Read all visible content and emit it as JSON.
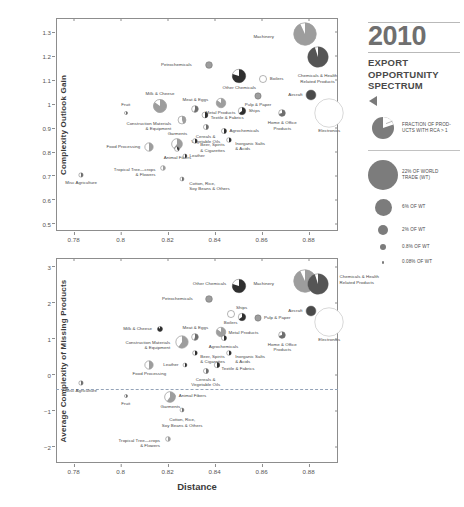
{
  "sidebar": {
    "year": "2010",
    "subtitle": "EXPORT\nOPPORTUNITY\nSPECTRUM",
    "triangle_icon": "left-triangle-icon",
    "legend": {
      "pie_note": "FRACTION OF PROD-\nUCTS WITH RCA > 1",
      "sizes": [
        {
          "label": "22% OF WORLD\nTRADE (WT)",
          "d": 30
        },
        {
          "label": "6% OF WT",
          "d": 17
        },
        {
          "label": "2% OF WT",
          "d": 10
        },
        {
          "label": "0.8% OF WT",
          "d": 6
        },
        {
          "label": "0.08% OF WT",
          "d": 2.5
        }
      ]
    }
  },
  "chart_data": [
    {
      "id": "top",
      "type": "scatter",
      "title": "",
      "xlabel": "Distance",
      "ylabel": "Complexity Outlook Gain",
      "xlim": [
        0.7725,
        0.8925
      ],
      "ylim": [
        0.47,
        1.36
      ],
      "xticks": [
        0.78,
        0.8,
        0.82,
        0.84,
        0.86,
        0.88
      ],
      "xticklabels": [
        "0.78",
        "0.8",
        "0.82",
        "0.84",
        "0.86",
        "0.88"
      ],
      "yticks": [
        0.5,
        0.6,
        0.7,
        0.8,
        0.9,
        1.0,
        1.1,
        1.2,
        1.3
      ],
      "yticklabels": [
        "0.5",
        "0.6",
        "0.7",
        "0.8",
        "0.9",
        "1",
        "1.1",
        "1.2",
        "1.3"
      ],
      "grid": false,
      "legend": "none",
      "points": [
        {
          "name": "Machinery",
          "x": 0.8785,
          "y": 1.295,
          "r": 11.5,
          "frac": 0.93,
          "shade": "#9d9d9d",
          "lx": -31,
          "ly": 3,
          "align": "right"
        },
        {
          "name": "Chemicals & Health\nRelated Products",
          "x": 0.8838,
          "y": 1.195,
          "r": 10.5,
          "frac": 0.95,
          "shade": "#555555",
          "lx": 0,
          "ly": 19,
          "align": "center"
        },
        {
          "name": "Petrochemicals",
          "x": 0.8375,
          "y": 1.165,
          "r": 3.6,
          "frac": 1.0,
          "shade": "#9d9d9d",
          "lx": -17,
          "ly": 0,
          "align": "right"
        },
        {
          "name": "Other Chemicals",
          "x": 0.8505,
          "y": 1.118,
          "r": 7.0,
          "frac": 0.8,
          "shade": "#2f2f2f",
          "lx": 0,
          "ly": 12,
          "align": "center"
        },
        {
          "name": "Boilers",
          "x": 0.8605,
          "y": 1.105,
          "r": 3.8,
          "frac": 0.0,
          "shade": "#c8c8c8",
          "lx": 7,
          "ly": 0,
          "align": "left"
        },
        {
          "name": "Aircraft",
          "x": 0.8808,
          "y": 1.04,
          "r": 5.2,
          "frac": 1.0,
          "shade": "#4a4a4a",
          "lx": -8,
          "ly": 0,
          "align": "right"
        },
        {
          "name": "Pulp & Paper",
          "x": 0.8585,
          "y": 1.035,
          "r": 3.4,
          "frac": 1.0,
          "shade": "#9d9d9d",
          "lx": 0,
          "ly": 9,
          "align": "center"
        },
        {
          "name": "Electronics",
          "x": 0.8888,
          "y": 0.965,
          "r": 14.5,
          "frac": 0.0,
          "shade": "#e4e4e4",
          "lx": 0,
          "ly": 18,
          "align": "center"
        },
        {
          "name": "Metal Products",
          "x": 0.8425,
          "y": 1.003,
          "r": 5.0,
          "frac": 0.85,
          "shade": "#9d9d9d",
          "lx": 0,
          "ly": 10,
          "align": "center"
        },
        {
          "name": "Ships",
          "x": 0.8515,
          "y": 0.972,
          "r": 4.0,
          "frac": 0.65,
          "shade": "#2f2f2f",
          "lx": 7,
          "ly": 0,
          "align": "left"
        },
        {
          "name": "Home & Office\nProducts",
          "x": 0.8688,
          "y": 0.962,
          "r": 3.6,
          "frac": 0.7,
          "shade": "#6e6e6e",
          "lx": 0,
          "ly": 10,
          "align": "center"
        },
        {
          "name": "Milk & Cheese",
          "x": 0.8168,
          "y": 0.993,
          "r": 6.8,
          "frac": 0.85,
          "shade": "#9d9d9d",
          "lx": 0,
          "ly": -12,
          "align": "center"
        },
        {
          "name": "Meat & Eggs",
          "x": 0.8318,
          "y": 0.978,
          "r": 3.6,
          "frac": 0.55,
          "shade": "#6e6e6e",
          "lx": 0,
          "ly": -9,
          "align": "center"
        },
        {
          "name": "Textile & Fabrics",
          "x": 0.8358,
          "y": 0.955,
          "r": 3.2,
          "frac": 0.5,
          "shade": "#2f2f2f",
          "lx": 6,
          "ly": 3,
          "align": "left"
        },
        {
          "name": "Fruit",
          "x": 0.8022,
          "y": 0.965,
          "r": 1.8,
          "frac": 0.5,
          "shade": "#6e6e6e",
          "lx": 0,
          "ly": -8,
          "align": "center"
        },
        {
          "name": "Construction Materials\n& Equipment",
          "x": 0.8262,
          "y": 0.935,
          "r": 4.2,
          "frac": 0.45,
          "shade": "#9d9d9d",
          "lx": -11,
          "ly": 4,
          "align": "right"
        },
        {
          "name": "Cereals &\nVegetable Oils",
          "x": 0.8362,
          "y": 0.905,
          "r": 2.8,
          "frac": 0.5,
          "shade": "#6e6e6e",
          "lx": 0,
          "ly": 10,
          "align": "center"
        },
        {
          "name": "Agrochemicals",
          "x": 0.8438,
          "y": 0.888,
          "r": 2.8,
          "frac": 0.5,
          "shade": "#2f2f2f",
          "lx": 6,
          "ly": 0,
          "align": "left"
        },
        {
          "name": "Inorganic Salts\n& Acids",
          "x": 0.8462,
          "y": 0.852,
          "r": 2.6,
          "frac": 0.5,
          "shade": "#2f2f2f",
          "lx": 6,
          "ly": 4,
          "align": "left"
        },
        {
          "name": "Beer, Spirits\n& Cigarettes",
          "x": 0.8318,
          "y": 0.845,
          "r": 2.6,
          "frac": 0.5,
          "shade": "#2f2f2f",
          "lx": 5,
          "ly": 4,
          "align": "left"
        },
        {
          "name": "Garments",
          "x": 0.8242,
          "y": 0.832,
          "r": 5.6,
          "frac": 0.6,
          "shade": "#9d9d9d",
          "lx": 0,
          "ly": -10,
          "align": "center"
        },
        {
          "name": "Animal Fibers",
          "x": 0.8242,
          "y": 0.812,
          "r": 2.6,
          "frac": 0.4,
          "shade": "#3a3a3a",
          "lx": 0,
          "ly": 9,
          "align": "center"
        },
        {
          "name": "Food Processing",
          "x": 0.8122,
          "y": 0.822,
          "r": 4.4,
          "frac": 0.5,
          "shade": "#9d9d9d",
          "lx": -9,
          "ly": 0,
          "align": "right"
        },
        {
          "name": "Leather",
          "x": 0.8272,
          "y": 0.782,
          "r": 2.2,
          "frac": 0.5,
          "shade": "#2f2f2f",
          "lx": 5,
          "ly": 0,
          "align": "left"
        },
        {
          "name": "Misc Agriculture",
          "x": 0.7832,
          "y": 0.702,
          "r": 2.4,
          "frac": 0.5,
          "shade": "#6e6e6e",
          "lx": 0,
          "ly": 8,
          "align": "center"
        },
        {
          "name": "Tropical Tree—crops\n& Flowers",
          "x": 0.8182,
          "y": 0.735,
          "r": 2.6,
          "frac": 0.5,
          "shade": "#9d9d9d",
          "lx": -8,
          "ly": 2,
          "align": "right"
        },
        {
          "name": "Cotton, Rice,\nSoy Beans & Others",
          "x": 0.8262,
          "y": 0.688,
          "r": 2.2,
          "frac": 0.5,
          "shade": "#6e6e6e",
          "lx": 7,
          "ly": 5,
          "align": "left"
        }
      ]
    },
    {
      "id": "bottom",
      "type": "scatter",
      "title": "",
      "xlabel": "Distance",
      "ylabel": "Average Complexity of Missing Products",
      "xlim": [
        0.7725,
        0.8925
      ],
      "ylim": [
        -2.45,
        3.25
      ],
      "xticks": [
        0.78,
        0.8,
        0.82,
        0.84,
        0.86,
        0.88
      ],
      "xticklabels": [
        "0.78",
        "0.8",
        "0.82",
        "0.84",
        "0.86",
        "0.88"
      ],
      "yticks": [
        -2,
        -1,
        0,
        1,
        2,
        3
      ],
      "yticklabels": [
        "−2",
        "−1",
        "0",
        "1",
        "2",
        "3"
      ],
      "reference_line": {
        "y": -0.4,
        "style": "dashed",
        "color": "#8f9fb5"
      },
      "grid": false,
      "legend": "none",
      "points": [
        {
          "name": "Machinery",
          "x": 0.8785,
          "y": 2.62,
          "r": 11.5,
          "frac": 0.93,
          "shade": "#9d9d9d",
          "lx": -31,
          "ly": 3,
          "align": "right"
        },
        {
          "name": "Chemicals & Health\nRelated Products",
          "x": 0.8838,
          "y": 2.52,
          "r": 10.5,
          "frac": 0.95,
          "shade": "#555555",
          "lx": 22,
          "ly": -7,
          "align": "left"
        },
        {
          "name": "Other Chemicals",
          "x": 0.8505,
          "y": 2.48,
          "r": 7.0,
          "frac": 0.8,
          "shade": "#2f2f2f",
          "lx": -13,
          "ly": -2,
          "align": "right"
        },
        {
          "name": "Petrochemicals",
          "x": 0.8375,
          "y": 2.12,
          "r": 3.6,
          "frac": 1.0,
          "shade": "#9d9d9d",
          "lx": -16,
          "ly": 0,
          "align": "right"
        },
        {
          "name": "Aircraft",
          "x": 0.8808,
          "y": 1.78,
          "r": 5.2,
          "frac": 1.0,
          "shade": "#4a4a4a",
          "lx": -8,
          "ly": 0,
          "align": "right"
        },
        {
          "name": "Electronics",
          "x": 0.8888,
          "y": 1.48,
          "r": 14.5,
          "frac": 0.0,
          "shade": "#e4e4e4",
          "lx": 0,
          "ly": 18,
          "align": "center"
        },
        {
          "name": "Boilers",
          "x": 0.8468,
          "y": 1.68,
          "r": 3.8,
          "frac": 0.0,
          "shade": "#c8c8c8",
          "lx": 0,
          "ly": 9,
          "align": "center"
        },
        {
          "name": "Ships",
          "x": 0.8515,
          "y": 1.62,
          "r": 4.0,
          "frac": 0.65,
          "shade": "#2f2f2f",
          "lx": 0,
          "ly": -9,
          "align": "center"
        },
        {
          "name": "Pulp & Paper",
          "x": 0.8585,
          "y": 1.58,
          "r": 3.4,
          "frac": 1.0,
          "shade": "#9d9d9d",
          "lx": 6,
          "ly": 0,
          "align": "left"
        },
        {
          "name": "Metal Products",
          "x": 0.8425,
          "y": 1.18,
          "r": 5.0,
          "frac": 0.85,
          "shade": "#9d9d9d",
          "lx": 8,
          "ly": 1,
          "align": "left"
        },
        {
          "name": "Home & Office\nProducts",
          "x": 0.8688,
          "y": 1.12,
          "r": 3.6,
          "frac": 0.7,
          "shade": "#6e6e6e",
          "lx": 0,
          "ly": 10,
          "align": "center"
        },
        {
          "name": "Meat & Eggs",
          "x": 0.8318,
          "y": 1.05,
          "r": 3.6,
          "frac": 0.55,
          "shade": "#6e6e6e",
          "lx": 0,
          "ly": -9,
          "align": "center"
        },
        {
          "name": "Agrochemicals",
          "x": 0.8438,
          "y": 1.02,
          "r": 2.8,
          "frac": 0.5,
          "shade": "#2f2f2f",
          "lx": 0,
          "ly": 9,
          "align": "center"
        },
        {
          "name": "Milk & Cheese",
          "x": 0.8168,
          "y": 1.28,
          "r": 2.8,
          "frac": 0.9,
          "shade": "#2f2f2f",
          "lx": -8,
          "ly": 0,
          "align": "right"
        },
        {
          "name": "Construction Materials\n& Equipment",
          "x": 0.8262,
          "y": 0.92,
          "r": 6.4,
          "frac": 0.6,
          "shade": "#9d9d9d",
          "lx": -12,
          "ly": 1,
          "align": "right"
        },
        {
          "name": "Inorganic Salts\n& Acids",
          "x": 0.8462,
          "y": 0.62,
          "r": 2.6,
          "frac": 0.5,
          "shade": "#2f2f2f",
          "lx": 6,
          "ly": 4,
          "align": "left"
        },
        {
          "name": "Beer, Spirits\n& Cigarettes",
          "x": 0.8318,
          "y": 0.62,
          "r": 2.6,
          "frac": 0.5,
          "shade": "#2f2f2f",
          "lx": 5,
          "ly": 4,
          "align": "left"
        },
        {
          "name": "Textile & Fabrics",
          "x": 0.8408,
          "y": 0.28,
          "r": 3.0,
          "frac": 0.5,
          "shade": "#2f2f2f",
          "lx": 5,
          "ly": 4,
          "align": "left"
        },
        {
          "name": "Food Processing",
          "x": 0.8122,
          "y": 0.28,
          "r": 4.4,
          "frac": 0.5,
          "shade": "#9d9d9d",
          "lx": 0,
          "ly": 9,
          "align": "center"
        },
        {
          "name": "Leather",
          "x": 0.8272,
          "y": 0.28,
          "r": 2.2,
          "frac": 0.5,
          "shade": "#2f2f2f",
          "lx": -6,
          "ly": 0,
          "align": "right"
        },
        {
          "name": "Cereals &\nVegetable Oils",
          "x": 0.8362,
          "y": 0.12,
          "r": 2.8,
          "frac": 0.5,
          "shade": "#6e6e6e",
          "lx": 0,
          "ly": 9,
          "align": "center"
        },
        {
          "name": "Misc Agriculture",
          "x": 0.7832,
          "y": -0.22,
          "r": 2.4,
          "frac": 0.5,
          "shade": "#6e6e6e",
          "lx": 0,
          "ly": 8,
          "align": "center"
        },
        {
          "name": "Animal Fibers",
          "x": 0.8222,
          "y": -0.58,
          "r": 2.4,
          "frac": 0.4,
          "shade": "#3a3a3a",
          "lx": 6,
          "ly": 0,
          "align": "left"
        },
        {
          "name": "Garments",
          "x": 0.8212,
          "y": -0.62,
          "r": 5.6,
          "frac": 0.6,
          "shade": "#9d9d9d",
          "lx": 0,
          "ly": 10,
          "align": "center"
        },
        {
          "name": "Fruit",
          "x": 0.8022,
          "y": -0.58,
          "r": 1.8,
          "frac": 0.5,
          "shade": "#6e6e6e",
          "lx": 0,
          "ly": 8,
          "align": "center"
        },
        {
          "name": "Cotton, Rice,\nSoy Beans & Others",
          "x": 0.8262,
          "y": -0.98,
          "r": 2.2,
          "frac": 0.5,
          "shade": "#6e6e6e",
          "lx": 0,
          "ly": 10,
          "align": "center"
        },
        {
          "name": "Tropical Tree—crops\n& Flowers",
          "x": 0.8202,
          "y": -1.78,
          "r": 2.6,
          "frac": 0.5,
          "shade": "#9d9d9d",
          "lx": -8,
          "ly": 2,
          "align": "right"
        }
      ]
    }
  ]
}
